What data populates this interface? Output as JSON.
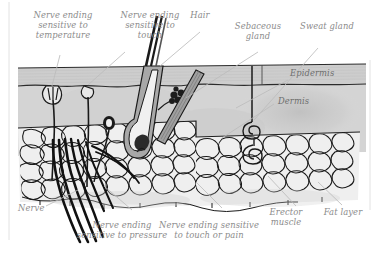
{
  "diagram": {
    "background_color": "#ffffff",
    "label_color": "#8b8b8b",
    "leader_line_color": "#b9b9b9",
    "ink_color": "#1a1a1a",
    "epidermis_fill": "#cfcfcf",
    "dermis_fill": "#d2d2d2",
    "fat_cell_fill": "#f2f2f2",
    "shadow_fill": "#bdbdbd"
  },
  "labels": {
    "nerve_ending_temperature": "Nerve ending\nsensitive to\ntemperature",
    "nerve_ending_touch": "Nerve ending\nsensitive to\ntouch",
    "hair": "Hair",
    "sebaceous_gland": "Sebaceous\ngland",
    "sweat_gland": "Sweat gland",
    "epidermis": "Epidermis",
    "dermis": "Dermis",
    "nerve": "Nerve",
    "nerve_ending_pressure": "Nerve ending\nsensitive to pressure",
    "nerve_ending_touch_pain": "Nerve ending sensitive\nto touch or pain",
    "erector_muscle": "Erector\nmuscle",
    "fat_layer": "Fat layer"
  },
  "structures": [
    "epidermis-band",
    "dermis-layer",
    "fat-layer",
    "hair-shaft",
    "hair-follicle",
    "hair-bulb",
    "sebaceous-gland",
    "sweat-gland-duct",
    "sweat-gland-coil",
    "erector-muscle",
    "nerve-bundle",
    "nerve-ending-temperature",
    "nerve-ending-touch",
    "nerve-ending-pressure"
  ]
}
